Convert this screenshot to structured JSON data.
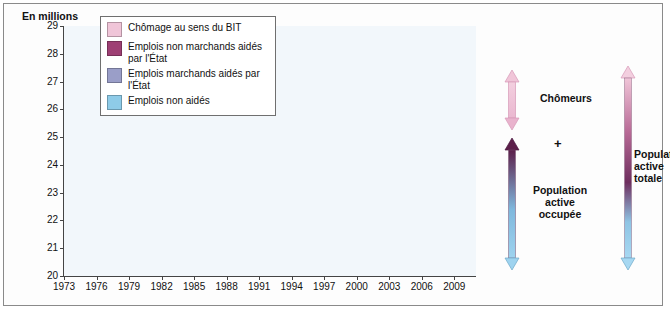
{
  "unit_label": "En millions",
  "legend": {
    "items": [
      {
        "label": "Chômage au sens du BIT",
        "color": "#f0c5d8"
      },
      {
        "label": "Emplois non marchands aidés par l'État",
        "color": "#9e3f74"
      },
      {
        "label": "Emplois marchands aidés par l'État",
        "color": "#9a9ec8"
      },
      {
        "label": "Emplois non aidés",
        "color": "#8ecbe8"
      }
    ]
  },
  "annotations": {
    "chomeurs": "Chômeurs",
    "plus": "+",
    "population_active_occupee": "Population\nactive\noccupée",
    "population_active_totale": "Population\nactive\ntotale",
    "chomeurs_line1": "Chômeurs",
    "pao_line1": "Population",
    "pao_line2": "active",
    "pao_line3": "occupée",
    "pat_line1": "Population",
    "pat_line2": "active",
    "pat_line3": "totale"
  },
  "chart_data": {
    "type": "area",
    "title": "",
    "xlabel": "",
    "ylabel": "En millions",
    "ylim": [
      20,
      29
    ],
    "xlim": [
      1973,
      2011
    ],
    "grid": false,
    "stacked": true,
    "yticks": [
      20,
      21,
      22,
      23,
      24,
      25,
      26,
      27,
      28,
      29
    ],
    "xticks": [
      1973,
      1976,
      1979,
      1982,
      1985,
      1988,
      1991,
      1994,
      1997,
      2000,
      2003,
      2006,
      2009
    ],
    "x": [
      1973,
      1974,
      1975,
      1976,
      1977,
      1978,
      1979,
      1980,
      1981,
      1982,
      1983,
      1984,
      1985,
      1986,
      1987,
      1988,
      1989,
      1990,
      1991,
      1992,
      1993,
      1994,
      1995,
      1996,
      1997,
      1998,
      1999,
      2000,
      2001,
      2002,
      2003,
      2004,
      2005,
      2006,
      2007,
      2008,
      2009,
      2010,
      2011
    ],
    "series": [
      {
        "name": "Emplois non aidés",
        "color": "#8ecbe8",
        "values": [
          21.0,
          21.2,
          21.1,
          21.2,
          21.25,
          21.3,
          21.3,
          21.3,
          21.1,
          21.0,
          20.9,
          20.8,
          20.7,
          20.8,
          20.9,
          21.1,
          21.4,
          21.7,
          21.7,
          21.5,
          21.2,
          21.3,
          21.5,
          21.5,
          21.7,
          22.1,
          22.5,
          23.0,
          23.4,
          23.5,
          23.5,
          23.6,
          23.8,
          24.1,
          24.5,
          24.5,
          24.0,
          24.4,
          24.4
        ]
      },
      {
        "name": "Emplois marchands aidés par l'État",
        "color": "#9a9ec8",
        "values": [
          0.02,
          0.02,
          0.03,
          0.05,
          0.08,
          0.1,
          0.1,
          0.1,
          0.12,
          0.15,
          0.18,
          0.2,
          0.22,
          0.25,
          0.3,
          0.32,
          0.3,
          0.28,
          0.3,
          0.35,
          0.4,
          0.45,
          0.5,
          0.55,
          0.55,
          0.55,
          0.55,
          0.5,
          0.45,
          0.45,
          0.45,
          0.45,
          0.45,
          0.5,
          0.55,
          0.5,
          0.5,
          0.5,
          0.5
        ]
      },
      {
        "name": "Emplois non marchands aidés par l'État",
        "color": "#9e3f74",
        "values": [
          0.05,
          0.05,
          0.06,
          0.08,
          0.12,
          0.15,
          0.18,
          0.2,
          0.22,
          0.25,
          0.28,
          0.32,
          0.4,
          0.45,
          0.48,
          0.5,
          0.48,
          0.45,
          0.48,
          0.55,
          0.62,
          0.7,
          0.72,
          0.7,
          0.72,
          0.8,
          0.85,
          0.85,
          0.8,
          0.75,
          0.7,
          0.68,
          0.7,
          0.75,
          0.8,
          0.75,
          0.8,
          0.8,
          0.8
        ]
      },
      {
        "name": "Chômage au sens du BIT",
        "color": "#f0c5d8",
        "values": [
          0.45,
          0.5,
          0.75,
          0.9,
          1.05,
          1.1,
          1.25,
          1.35,
          1.65,
          1.85,
          1.95,
          2.15,
          2.3,
          2.35,
          2.35,
          2.3,
          2.15,
          2.05,
          2.2,
          2.4,
          2.75,
          2.85,
          2.75,
          2.9,
          3.0,
          2.85,
          2.75,
          2.4,
          2.15,
          2.25,
          2.4,
          2.45,
          2.4,
          2.2,
          2.0,
          1.95,
          2.5,
          2.6,
          2.6
        ]
      }
    ],
    "totals": [
      21.52,
      21.77,
      21.94,
      22.23,
      22.5,
      22.65,
      22.83,
      22.95,
      23.09,
      23.25,
      23.31,
      23.47,
      23.62,
      23.85,
      24.03,
      24.22,
      24.33,
      24.48,
      24.68,
      24.8,
      24.97,
      25.3,
      25.47,
      25.65,
      25.97,
      26.3,
      26.65,
      26.75,
      26.8,
      26.95,
      27.05,
      27.18,
      27.35,
      27.55,
      27.85,
      27.7,
      27.8,
      28.3,
      28.3
    ]
  }
}
